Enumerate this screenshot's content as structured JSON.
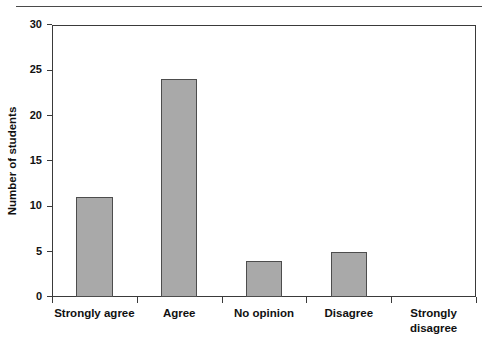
{
  "chart_data": {
    "type": "bar",
    "title": "",
    "subtitle": "",
    "xlabel": "",
    "ylabel": "Number of students",
    "categories": [
      "Strongly agree",
      "Agree",
      "No opinion",
      "Disagree",
      "Strongly disagree"
    ],
    "category_lines": [
      [
        "Strongly agree"
      ],
      [
        "Agree"
      ],
      [
        "No opinion"
      ],
      [
        "Disagree"
      ],
      [
        "Strongly",
        "disagree"
      ]
    ],
    "values": [
      11,
      24,
      4,
      5,
      0
    ],
    "ylim": [
      0,
      30
    ],
    "yticks": [
      0,
      5,
      10,
      15,
      20,
      25,
      30
    ],
    "ytick_labels": [
      "0",
      "5",
      "10",
      "15",
      "20",
      "25",
      "30"
    ],
    "grid": false,
    "legend": false,
    "legend_position": "none",
    "bar_fill_color": "#a9a9a9",
    "bar_edge_color": "#4d4d4d",
    "axis_color": "#3a3a3a",
    "text_color": "#111111",
    "background_color": "#ffffff"
  },
  "figure": {
    "top_rule_color": "#4a4a4a"
  }
}
